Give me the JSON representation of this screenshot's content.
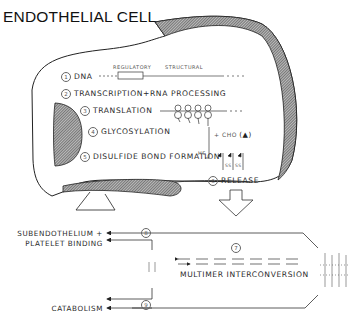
{
  "title": "ENDOTHELIAL CELL",
  "gene_labels": {
    "regulatory": "REGULATORY",
    "structural": "STRUCTURAL"
  },
  "steps": [
    {
      "num": "1",
      "label": "DNA"
    },
    {
      "num": "2",
      "label": "TRANSCRIPTION+RNA PROCESSING"
    },
    {
      "num": "3",
      "label": "TRANSLATION"
    },
    {
      "num": "4",
      "label": "GLYCOSYLATION"
    },
    {
      "num": "5",
      "label": "DISULFIDE BOND FORMATION"
    },
    {
      "num": "6",
      "label": "RELEASE"
    },
    {
      "num": "7",
      "label": "MULTIMER INTERCONVERSION"
    },
    {
      "num": "8",
      "label": "SUBENDOTHELIUM + PLATELET BINDING"
    },
    {
      "num": "9",
      "label": "CATABOLISM"
    }
  ],
  "annotations": {
    "hs": "HS",
    "plus": "+",
    "cho": "CHO",
    "cho_symbol": "(▲)",
    "ss": "SS"
  },
  "outputs": {
    "binding_line1": "SUBENDOTHELIUM +",
    "binding_line2": "PLATELET BINDING",
    "catabolism": "CATABOLISM"
  }
}
